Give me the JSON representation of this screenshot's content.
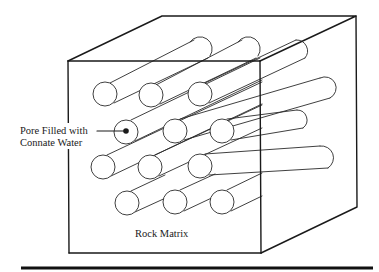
{
  "figure": {
    "type": "isometric block diagram",
    "labels": {
      "pore_line1": "Pore Filled with",
      "pore_line2": "Connate Water",
      "matrix": "Rock Matrix"
    },
    "colors": {
      "ink": "#1a1a1a",
      "background": "#ffffff"
    },
    "cube": {
      "front_face": {
        "x1": 68,
        "y1": 61,
        "x2": 260,
        "y2": 253
      },
      "depth_offset": {
        "dx": 96,
        "dy": -45
      }
    },
    "pore_grid": {
      "rows": 4,
      "cols": 3,
      "radius": 12,
      "highlighted_pore": {
        "row": 2,
        "col": 1
      }
    }
  }
}
